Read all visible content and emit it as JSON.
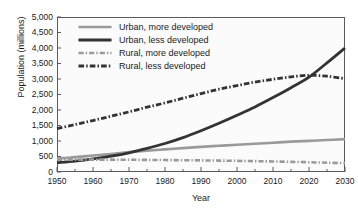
{
  "chart_data": {
    "type": "line",
    "title": "",
    "xlabel": "Year",
    "ylabel": "Population (millions)",
    "xlim": [
      1950,
      2030
    ],
    "ylim": [
      0,
      5000
    ],
    "grid": false,
    "legend_position": "top-left inside plot",
    "x_ticks": [
      1950,
      1960,
      1970,
      1980,
      1990,
      2000,
      2010,
      2020,
      2030
    ],
    "x_tick_labels": [
      "1950",
      "1960",
      "1970",
      "1980",
      "1990",
      "2000",
      "2010",
      "2020",
      "2030"
    ],
    "x_minor_tick_interval": 5,
    "y_ticks": [
      0,
      500,
      1000,
      1500,
      2000,
      2500,
      3000,
      3500,
      4000,
      4500,
      5000
    ],
    "y_tick_labels": [
      "0",
      "500",
      "1,000",
      "1,500",
      "2,000",
      "2,500",
      "3,000",
      "3,500",
      "4,000",
      "4,500",
      "5,000"
    ],
    "x": [
      1950,
      1955,
      1960,
      1965,
      1970,
      1975,
      1980,
      1985,
      1990,
      1995,
      2000,
      2005,
      2010,
      2015,
      2020,
      2025,
      2030
    ],
    "series": [
      {
        "name": "Urban, more developed",
        "color": "#9a9a9a",
        "style": "solid",
        "width": 2.6,
        "values": [
          430,
          480,
          530,
          580,
          640,
          690,
          730,
          770,
          810,
          845,
          880,
          910,
          945,
          980,
          1005,
          1030,
          1060
        ]
      },
      {
        "name": "Urban, less developed",
        "color": "#333333",
        "style": "solid",
        "width": 2.8,
        "values": [
          300,
          350,
          420,
          510,
          620,
          760,
          920,
          1110,
          1330,
          1570,
          1830,
          2100,
          2400,
          2720,
          3060,
          3520,
          4000
        ]
      },
      {
        "name": "Rural, more developed",
        "color": "#9a9a9a",
        "style": "dash-dot",
        "width": 2.6,
        "values": [
          395,
          400,
          400,
          398,
          395,
          390,
          385,
          380,
          375,
          368,
          360,
          350,
          340,
          328,
          315,
          300,
          285
        ]
      },
      {
        "name": "Rural, less developed",
        "color": "#333333",
        "style": "dash-dot",
        "width": 2.8,
        "values": [
          1400,
          1530,
          1660,
          1800,
          1940,
          2090,
          2230,
          2380,
          2530,
          2670,
          2790,
          2900,
          2990,
          3070,
          3120,
          3090,
          3010
        ]
      }
    ],
    "annotations": [
      "Urban, less developed crosses Rural, less developed at approximately 2017 near 3,100 million"
    ]
  },
  "legend": {
    "items": [
      {
        "label": "Urban, more developed"
      },
      {
        "label": "Urban, less developed"
      },
      {
        "label": "Rural, more developed"
      },
      {
        "label": "Rural, less developed"
      }
    ]
  }
}
